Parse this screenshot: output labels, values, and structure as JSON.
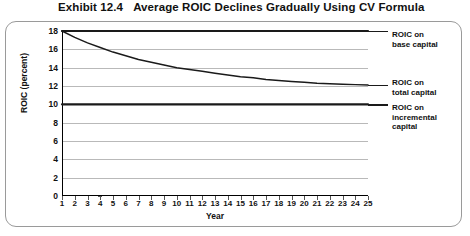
{
  "exhibit": {
    "number": "Exhibit 12.4",
    "title": "Average ROIC Declines Gradually Using CV Formula"
  },
  "chart_data": {
    "type": "line",
    "title": "Average ROIC Declines Gradually Using CV Formula",
    "xlabel": "Year",
    "ylabel": "ROIC (percent)",
    "xlim": [
      1,
      25
    ],
    "ylim": [
      0,
      18
    ],
    "ytick_values": [
      0,
      2,
      4,
      6,
      8,
      10,
      12,
      14,
      16,
      18
    ],
    "xtick_values": [
      1,
      2,
      3,
      4,
      5,
      6,
      7,
      8,
      9,
      10,
      11,
      12,
      13,
      14,
      15,
      16,
      17,
      18,
      19,
      20,
      21,
      22,
      23,
      24,
      25
    ],
    "grid": true,
    "legend_position": "right-outside-annotations",
    "x": [
      1,
      2,
      3,
      4,
      5,
      6,
      7,
      8,
      9,
      10,
      11,
      12,
      13,
      14,
      15,
      16,
      17,
      18,
      19,
      20,
      21,
      22,
      23,
      24,
      25
    ],
    "series": [
      {
        "name": "ROIC on base capital",
        "values": [
          18,
          18,
          18,
          18,
          18,
          18,
          18,
          18,
          18,
          18,
          18,
          18,
          18,
          18,
          18,
          18,
          18,
          18,
          18,
          18,
          18,
          18,
          18,
          18,
          18
        ],
        "color": "#1a1a1a",
        "width": 2.2
      },
      {
        "name": "ROIC on total capital",
        "values": [
          18.0,
          17.3,
          16.7,
          16.2,
          15.7,
          15.3,
          14.9,
          14.6,
          14.3,
          14.0,
          13.8,
          13.6,
          13.4,
          13.2,
          13.0,
          12.9,
          12.7,
          12.6,
          12.5,
          12.4,
          12.3,
          12.25,
          12.2,
          12.15,
          12.1
        ],
        "color": "#1a1a1a",
        "width": 1.5
      },
      {
        "name": "ROIC on incremental capital",
        "values": [
          10,
          10,
          10,
          10,
          10,
          10,
          10,
          10,
          10,
          10,
          10,
          10,
          10,
          10,
          10,
          10,
          10,
          10,
          10,
          10,
          10,
          10,
          10,
          10,
          10
        ],
        "color": "#1a1a1a",
        "width": 2.2
      }
    ],
    "annotations": [
      {
        "lines": [
          "ROIC on",
          "base capital"
        ]
      },
      {
        "lines": [
          "ROIC on",
          "total capital"
        ]
      },
      {
        "lines": [
          "ROIC on",
          "incremental",
          "capital"
        ]
      }
    ]
  }
}
